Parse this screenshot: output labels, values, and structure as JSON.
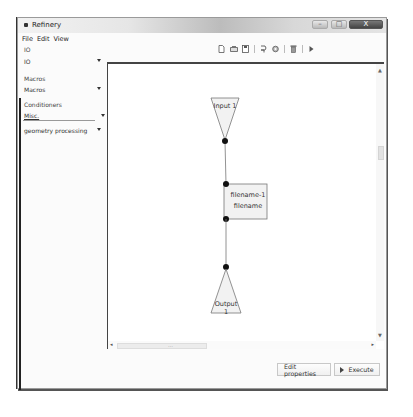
{
  "window": {
    "title": "Refinery",
    "controls": {
      "minimize": "–",
      "maximize": "□",
      "close": "X"
    }
  },
  "menubar": {
    "items": [
      "File",
      "Edit",
      "View"
    ]
  },
  "leftpanel": {
    "io_label": "IO",
    "io_combo": "IO",
    "macros_label": "Macros",
    "macros_combo": "Macros",
    "conditioners_label": "Conditioners",
    "conditioners_combo": "Misc.",
    "category_combo": "geometry processing"
  },
  "toolbar": {
    "icons": [
      "new-file-icon",
      "open-icon",
      "save-icon",
      "copy-icon",
      "settings-icon",
      "delete-icon",
      "run-icon"
    ]
  },
  "diagram": {
    "nodes": [
      {
        "id": "input",
        "label": "Input 1",
        "shape": "inverted-triangle"
      },
      {
        "id": "process",
        "label_line1": "filename-1",
        "label_line2": "filename",
        "shape": "rectangle"
      },
      {
        "id": "output",
        "label": "Output 1",
        "shape": "triangle"
      }
    ]
  },
  "buttons": {
    "edit_properties": "Edit properties",
    "execute": "Execute"
  }
}
